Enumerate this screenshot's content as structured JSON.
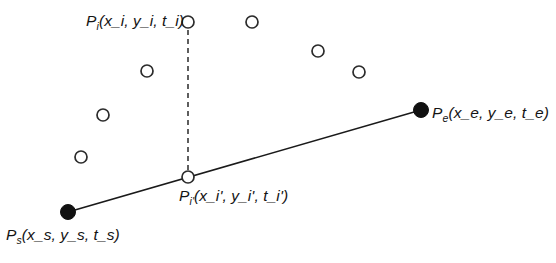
{
  "figure": {
    "type": "diagram",
    "background_color": "#ffffff",
    "stroke_color": "#1a1a1a",
    "label_color": "#141414"
  },
  "labels": {
    "p_i": {
      "base": "P",
      "sub": "i",
      "args": "(x_i, y_i, t_i)"
    },
    "p_e": {
      "base": "P",
      "sub": "e",
      "args": "(x_e, y_e, t_e)"
    },
    "p_s": {
      "base": "P",
      "sub": "s",
      "args": "(x_s, y_s, t_s)"
    },
    "p_i_prime": {
      "base": "P",
      "sub": "i'",
      "args": "(x_i', y_i', t_i')"
    }
  },
  "points": {
    "start": {
      "name": "P_s",
      "x": 68,
      "y": 212,
      "style": "filled",
      "radius": 7.5
    },
    "end": {
      "name": "P_e",
      "x": 421,
      "y": 110,
      "style": "filled",
      "radius": 7.5
    },
    "sample": {
      "name": "P_i",
      "x": 188,
      "y": 22,
      "style": "open",
      "radius": 6
    },
    "projection": {
      "name": "P_i'",
      "x": 188,
      "y": 177,
      "style": "open",
      "radius": 6
    }
  },
  "scatter_points": [
    {
      "x": 252,
      "y": 22,
      "style": "open",
      "radius": 6
    },
    {
      "x": 147,
      "y": 71,
      "style": "open",
      "radius": 6
    },
    {
      "x": 318,
      "y": 51,
      "style": "open",
      "radius": 6
    },
    {
      "x": 359,
      "y": 72,
      "style": "open",
      "radius": 6
    },
    {
      "x": 103,
      "y": 115,
      "style": "open",
      "radius": 6
    },
    {
      "x": 81,
      "y": 157,
      "style": "open",
      "radius": 6
    }
  ],
  "lines": {
    "segment": {
      "x1": 68,
      "y1": 212,
      "x2": 421,
      "y2": 110,
      "style": "solid",
      "width": 1.6
    },
    "projection_drop": {
      "x1": 188,
      "y1": 30,
      "x2": 188,
      "y2": 170,
      "style": "dashed",
      "width": 1.4,
      "dash": "5,4"
    }
  }
}
